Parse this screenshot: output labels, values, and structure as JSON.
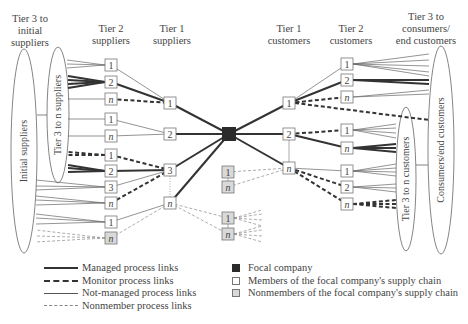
{
  "headers": {
    "tier3_initial_suppliers": [
      "Tier 3 to",
      "initial",
      "suppliers"
    ],
    "tier2_suppliers": [
      "Tier 2",
      "suppliers"
    ],
    "tier1_suppliers": [
      "Tier 1",
      "suppliers"
    ],
    "tier1_customers": [
      "Tier 1",
      "customers"
    ],
    "tier2_customers": [
      "Tier 2",
      "customers"
    ],
    "tier3_consumers": [
      "Tier 3 to",
      "consumers/",
      "end customers"
    ]
  },
  "ellipse_labels": {
    "initial_suppliers": "Initial suppliers",
    "tier3_n_suppliers": "Tier 3 to n suppliers",
    "tier3_n_customers": "Tier 3 to n customers",
    "consumers_end_customers": "Consumers/end customers"
  },
  "colors": {
    "focal": "#2b2b2b",
    "member_fill": "#ffffff",
    "nonmember_fill": "#d9d9d9",
    "line": "#333333",
    "thin_line": "#666666",
    "nonmember_line": "#888888"
  },
  "focal_company": {
    "x": 229,
    "y": 134
  },
  "nodes": [
    {
      "id": "s2_1a",
      "label": "1",
      "x": 111,
      "y": 65,
      "type": "member"
    },
    {
      "id": "s2_2a",
      "label": "2",
      "x": 111,
      "y": 82,
      "type": "member"
    },
    {
      "id": "s2_na",
      "label": "n",
      "x": 111,
      "y": 99,
      "type": "member"
    },
    {
      "id": "s2_1b",
      "label": "1",
      "x": 111,
      "y": 119,
      "type": "member"
    },
    {
      "id": "s2_nb",
      "label": "n",
      "x": 111,
      "y": 136,
      "type": "member"
    },
    {
      "id": "s2_1c",
      "label": "1",
      "x": 111,
      "y": 155,
      "type": "member"
    },
    {
      "id": "s2_2c",
      "label": "2",
      "x": 111,
      "y": 171,
      "type": "member"
    },
    {
      "id": "s2_3c",
      "label": "3",
      "x": 111,
      "y": 187,
      "type": "member"
    },
    {
      "id": "s2_nc",
      "label": "n",
      "x": 111,
      "y": 203,
      "type": "member"
    },
    {
      "id": "s2_1d",
      "label": "1",
      "x": 111,
      "y": 222,
      "type": "member"
    },
    {
      "id": "s2_nd",
      "label": "n",
      "x": 111,
      "y": 238,
      "type": "nonmember"
    },
    {
      "id": "s1_1",
      "label": "1",
      "x": 170,
      "y": 103,
      "type": "member"
    },
    {
      "id": "s1_2",
      "label": "2",
      "x": 170,
      "y": 134,
      "type": "member"
    },
    {
      "id": "s1_3",
      "label": "3",
      "x": 170,
      "y": 170,
      "type": "member"
    },
    {
      "id": "s1_n",
      "label": "n",
      "x": 170,
      "y": 203,
      "type": "member"
    },
    {
      "id": "c1_1",
      "label": "1",
      "x": 289,
      "y": 103,
      "type": "member"
    },
    {
      "id": "c1_2",
      "label": "2",
      "x": 289,
      "y": 134,
      "type": "member"
    },
    {
      "id": "c1_n",
      "label": "n",
      "x": 289,
      "y": 168,
      "type": "member"
    },
    {
      "id": "c2_1a",
      "label": "1",
      "x": 347,
      "y": 64,
      "type": "member"
    },
    {
      "id": "c2_2a",
      "label": "2",
      "x": 347,
      "y": 80,
      "type": "member"
    },
    {
      "id": "c2_na",
      "label": "n",
      "x": 347,
      "y": 97,
      "type": "member"
    },
    {
      "id": "c2_1b",
      "label": "1",
      "x": 347,
      "y": 130,
      "type": "member"
    },
    {
      "id": "c2_nb",
      "label": "n",
      "x": 347,
      "y": 148,
      "type": "member"
    },
    {
      "id": "c2_1c",
      "label": "1",
      "x": 347,
      "y": 171,
      "type": "member"
    },
    {
      "id": "c2_2c",
      "label": "2",
      "x": 347,
      "y": 187,
      "type": "member"
    },
    {
      "id": "c2_nc",
      "label": "n",
      "x": 347,
      "y": 204,
      "type": "member"
    },
    {
      "id": "nm_1a",
      "label": "1",
      "x": 228,
      "y": 172,
      "type": "nonmember"
    },
    {
      "id": "nm_na",
      "label": "n",
      "x": 228,
      "y": 187,
      "type": "nonmember"
    },
    {
      "id": "nm_1b",
      "label": "1",
      "x": 228,
      "y": 218,
      "type": "nonmember"
    },
    {
      "id": "nm_nb",
      "label": "n",
      "x": 228,
      "y": 234,
      "type": "nonmember"
    }
  ],
  "links": [
    {
      "from": "s1_1",
      "to": "focal",
      "kind": "managed"
    },
    {
      "from": "s1_2",
      "to": "focal",
      "kind": "managed"
    },
    {
      "from": "s1_3",
      "to": "focal",
      "kind": "managed"
    },
    {
      "from": "s1_n",
      "to": "focal",
      "kind": "managed"
    },
    {
      "from": "focal",
      "to": "c1_1",
      "kind": "managed"
    },
    {
      "from": "focal",
      "to": "c1_2",
      "kind": "managed"
    },
    {
      "from": "focal",
      "to": "c1_n",
      "kind": "managed"
    },
    {
      "from": "s2_1a",
      "to": "s1_1",
      "kind": "notmanaged"
    },
    {
      "from": "s2_2a",
      "to": "s1_1",
      "kind": "managed"
    },
    {
      "from": "s2_na",
      "to": "s1_1",
      "kind": "monitor"
    },
    {
      "from": "s2_1b",
      "to": "s1_2",
      "kind": "notmanaged"
    },
    {
      "from": "s2_nb",
      "to": "s1_2",
      "kind": "notmanaged"
    },
    {
      "from": "s2_1c",
      "to": "s1_3",
      "kind": "monitor"
    },
    {
      "from": "s2_2c",
      "to": "s1_3",
      "kind": "managed"
    },
    {
      "from": "s2_3c",
      "to": "s1_3",
      "kind": "notmanaged"
    },
    {
      "from": "s2_nc",
      "to": "s1_3",
      "kind": "monitor"
    },
    {
      "from": "s2_1d",
      "to": "s1_n",
      "kind": "notmanaged"
    },
    {
      "from": "s2_nd",
      "to": "s1_n",
      "kind": "nonmember"
    },
    {
      "from": "s1_n",
      "to": "nm_1b",
      "kind": "nonmember"
    },
    {
      "from": "s1_n",
      "to": "nm_nb",
      "kind": "nonmember"
    },
    {
      "from": "c1_1",
      "to": "c2_1a",
      "kind": "notmanaged"
    },
    {
      "from": "c1_1",
      "to": "c2_2a",
      "kind": "managed"
    },
    {
      "from": "c1_1",
      "to": "c2_na",
      "kind": "monitor"
    },
    {
      "from": "c1_2",
      "to": "c2_1b",
      "kind": "monitor"
    },
    {
      "from": "c1_2",
      "to": "c2_nb",
      "kind": "managed"
    },
    {
      "from": "c1_n",
      "to": "c2_1c",
      "kind": "notmanaged"
    },
    {
      "from": "c1_n",
      "to": "c2_2c",
      "kind": "monitor"
    },
    {
      "from": "c1_n",
      "to": "c2_nc",
      "kind": "monitor"
    },
    {
      "from": "nm_1a",
      "to": "c1_n",
      "kind": "nonmember"
    },
    {
      "from": "nm_na",
      "to": "c1_n",
      "kind": "nonmember"
    }
  ],
  "legend": {
    "lines": [
      {
        "kind": "managed",
        "label": "Managed process links"
      },
      {
        "kind": "monitor",
        "label": "Monitor process links"
      },
      {
        "kind": "notmanaged",
        "label": "Not-managed process links"
      },
      {
        "kind": "nonmember",
        "label": "Nonmember process links"
      }
    ],
    "boxes": [
      {
        "kind": "focal",
        "label": "Focal company"
      },
      {
        "kind": "member",
        "label": "Members of the focal company's supply chain"
      },
      {
        "kind": "nonmember",
        "label": "Nonmembers of the focal company's supply chain"
      }
    ]
  }
}
